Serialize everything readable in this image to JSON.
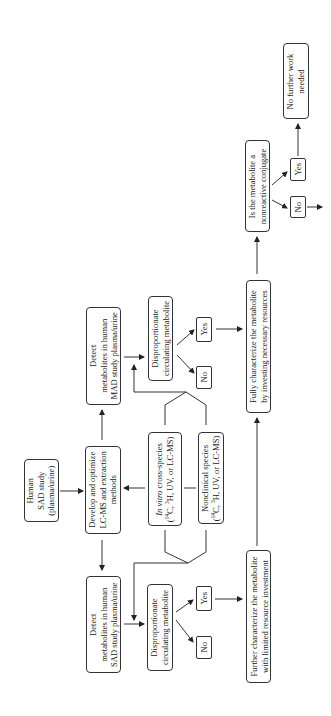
{
  "diagram": {
    "orientation": "rotated 90 degrees counter-clockwise",
    "nodes": {
      "human_sad": {
        "lines": [
          "Human",
          "SAD study",
          "(plasma/urine)"
        ]
      },
      "develop": {
        "lines": [
          "Develop and optimize",
          "LC-MS and extraction",
          "methods"
        ]
      },
      "in_vitro": {
        "line1_italic": "In vitro",
        "line1_rest": " cross-species",
        "line2": "(14C, 3H, UV, or LC-MS)"
      },
      "nonclinical": {
        "line1": "Nonclinical species",
        "line2": "(14C, 3H, UV, or LC-MS)"
      },
      "detect_sad": {
        "lines": [
          "Detect",
          "metabolites in human",
          "SAD study plasma/urine"
        ]
      },
      "detect_mad": {
        "lines": [
          "Detect",
          "metabolites in human",
          "MAD study plasma/urine"
        ]
      },
      "dispro_sad": {
        "lines": [
          "Disproportionate",
          "circulating metabolite"
        ]
      },
      "dispro_mad": {
        "lines": [
          "Disproportionate",
          "circulating metabolite"
        ]
      },
      "sad_no": "No",
      "sad_yes": "Yes",
      "mad_no": "No",
      "mad_yes": "Yes",
      "further": {
        "lines": [
          "Further characterize the metabolite",
          "with limited resource investment"
        ]
      },
      "fully": {
        "lines": [
          "Fully characterize the metabolite",
          "by investing necessary resources"
        ]
      },
      "conjugate": {
        "lines": [
          "Is the metabolite a",
          "nonreactive conjugate"
        ]
      },
      "conj_no": "No",
      "conj_yes": "Yes",
      "no_further": {
        "lines": [
          "No further work",
          "needed"
        ]
      }
    },
    "edges": [
      [
        "Human SAD study",
        "Develop and optimize"
      ],
      [
        "Develop and optimize",
        "Detect SAD"
      ],
      [
        "Develop and optimize",
        "Detect MAD"
      ],
      [
        "In vitro / Nonclinical",
        "Develop and optimize"
      ],
      [
        "In vitro / Nonclinical",
        "Disproportionate (SAD)"
      ],
      [
        "In vitro / Nonclinical",
        "Disproportionate (MAD)"
      ],
      [
        "Detect SAD",
        "Disproportionate (SAD)"
      ],
      [
        "Detect MAD",
        "Disproportionate (MAD)"
      ],
      [
        "Disproportionate (SAD)",
        "No"
      ],
      [
        "Disproportionate (SAD)",
        "Yes"
      ],
      [
        "Yes (SAD)",
        "Further characterize"
      ],
      [
        "Further characterize",
        "Fully characterize"
      ],
      [
        "Disproportionate (MAD)",
        "No"
      ],
      [
        "Disproportionate (MAD)",
        "Yes"
      ],
      [
        "Yes (MAD)",
        "Fully characterize"
      ],
      [
        "Fully characterize",
        "Is the metabolite a nonreactive conjugate"
      ],
      [
        "Is conjugate",
        "No"
      ],
      [
        "Is conjugate",
        "Yes"
      ],
      [
        "Yes (conjugate)",
        "No further work needed"
      ],
      [
        "No (conjugate)",
        "continue"
      ]
    ]
  }
}
